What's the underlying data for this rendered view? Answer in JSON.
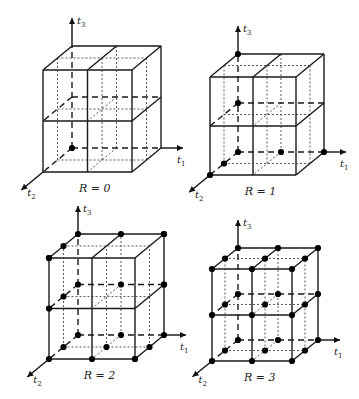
{
  "figure": {
    "panels": [
      {
        "caption": "R = 0",
        "R": 0,
        "origin": [
          72,
          148
        ],
        "dx": 89,
        "dy": 102,
        "depth": [
          -29,
          24
        ],
        "axis_labels": {
          "t1": "t",
          "t1_sub": "1",
          "t2": "t",
          "t2_sub": "2",
          "t3": "t",
          "t3_sub": "3"
        },
        "nodes_per_axis": 1
      },
      {
        "caption": "R = 1",
        "R": 1,
        "origin": [
          238,
          152
        ],
        "dx": 86,
        "dy": 98,
        "depth": [
          -28,
          23
        ],
        "axis_labels": {
          "t1": "t",
          "t1_sub": "1",
          "t2": "t",
          "t2_sub": "2",
          "t3": "t",
          "t3_sub": "3"
        },
        "nodes_per_axis": 2
      },
      {
        "caption": "R = 2",
        "R": 2,
        "origin": [
          78,
          335
        ],
        "dx": 86,
        "dy": 101,
        "depth": [
          -29,
          24
        ],
        "axis_labels": {
          "t1": "t",
          "t1_sub": "1",
          "t2": "t",
          "t2_sub": "2",
          "t3": "t",
          "t3_sub": "3"
        },
        "nodes_per_axis": 3
      },
      {
        "caption": "R = 3",
        "R": 3,
        "origin": [
          238,
          340
        ],
        "dx": 80,
        "dy": 92,
        "depth": [
          -26,
          21
        ],
        "axis_labels": {
          "t1": "t",
          "t1_sub": "1",
          "t2": "t",
          "t2_sub": "2",
          "t3": "t",
          "t3_sub": "3"
        },
        "nodes_per_axis": 4
      }
    ],
    "styles": {
      "line_color": "#1a1a1a",
      "node_color": "#000000",
      "background": "#ffffff"
    }
  }
}
